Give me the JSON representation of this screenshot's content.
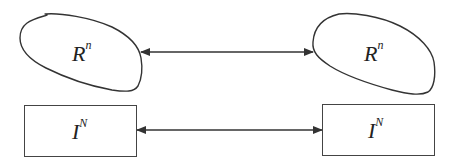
{
  "diagram": {
    "top_left": {
      "shape": "blob",
      "label_base": "R",
      "label_sup": "n"
    },
    "top_right": {
      "shape": "blob",
      "label_base": "R",
      "label_sup": "n"
    },
    "bottom_left": {
      "shape": "rectangle",
      "label_base": "I",
      "label_sup": "N"
    },
    "bottom_right": {
      "shape": "rectangle",
      "label_base": "I",
      "label_sup": "N"
    },
    "arrows": [
      {
        "from": "top_left",
        "to": "top_right",
        "type": "bidirectional"
      },
      {
        "from": "bottom_left",
        "to": "bottom_right",
        "type": "bidirectional"
      }
    ],
    "stroke_color": "#333333"
  }
}
